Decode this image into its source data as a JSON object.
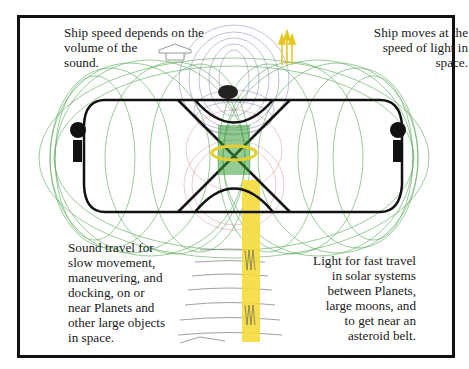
{
  "diagram": {
    "title": "",
    "colors": {
      "frame": "#111111",
      "hull": "#111111",
      "sound_field": "#3a9a3a",
      "light_beam": "#f5dc3c",
      "purple_field": "#8a78b0",
      "red_field": "#c05050",
      "background": "#ffffff"
    },
    "annotations": {
      "top_left": "Ship speed depends on the\nvolume of the\nsound.",
      "top_right": "Ship moves at the\nspeed of light in\nspace.",
      "bottom_left": "Sound travel for\nslow movement,\nmaneuvering, and\ndocking, on or\nnear Planets and\nother large objects\nin space.",
      "bottom_right": "Light for fast travel\nin solar systems\nbetween Planets,\nlarge moons, and\nto get near an\nasteroid belt."
    },
    "icons": {
      "up_arrow_outline": "hollow-up-arrow",
      "light_arrows": "yellow-triple-up-arrows",
      "left_speaker": "speaker-left",
      "right_speaker": "speaker-right",
      "dome": "top-dome",
      "light_beam": "yellow-light-beam"
    }
  }
}
